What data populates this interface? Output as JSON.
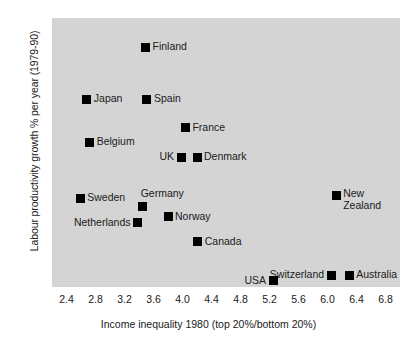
{
  "chart_data": {
    "type": "scatter",
    "title": "",
    "xlabel": "Income inequality 1980 (top 20%/bottom 20%)",
    "ylabel": "Labour productivity growth % per year (1979-90)",
    "xlim": [
      2.2,
      7.0
    ],
    "ylim": [
      0.6,
      4.0
    ],
    "xticks": [
      "2.4",
      "2.8",
      "3.2",
      "3.6",
      "4.0",
      "4.4",
      "4.8",
      "5.2",
      "5.6",
      "6.0",
      "6.4",
      "6.8"
    ],
    "yticks": [
      "3.8",
      "3.4",
      "3.0",
      "2.6",
      "2.2",
      "1.8",
      "1.4",
      "1.0",
      "0.6"
    ],
    "grid": false,
    "legend": "none",
    "marker_color": "#000000",
    "panel_color": "#d4d4d4",
    "points": [
      {
        "label": "Finland",
        "x": 3.49,
        "y": 3.63,
        "label_pos": "right"
      },
      {
        "label": "Japan",
        "x": 2.68,
        "y": 2.97,
        "label_pos": "right"
      },
      {
        "label": "Spain",
        "x": 3.51,
        "y": 2.97,
        "label_pos": "right"
      },
      {
        "label": "France",
        "x": 4.04,
        "y": 2.61,
        "label_pos": "right"
      },
      {
        "label": "Belgium",
        "x": 2.72,
        "y": 2.43,
        "label_pos": "right"
      },
      {
        "label": "UK",
        "x": 3.98,
        "y": 2.24,
        "label_pos": "left"
      },
      {
        "label": "Denmark",
        "x": 4.2,
        "y": 2.24,
        "label_pos": "right"
      },
      {
        "label": "Sweden",
        "x": 2.59,
        "y": 1.72,
        "label_pos": "right"
      },
      {
        "label": "Germany",
        "x": 3.45,
        "y": 1.62,
        "label_pos": "above"
      },
      {
        "label": "New\nZealand",
        "x": 6.12,
        "y": 1.76,
        "label_pos": "right-two"
      },
      {
        "label": "Norway",
        "x": 3.8,
        "y": 1.49,
        "label_pos": "right"
      },
      {
        "label": "Netherlands",
        "x": 3.38,
        "y": 1.41,
        "label_pos": "left"
      },
      {
        "label": "Canada",
        "x": 4.21,
        "y": 1.17,
        "label_pos": "right"
      },
      {
        "label": "Switzerland",
        "x": 6.05,
        "y": 0.75,
        "label_pos": "left"
      },
      {
        "label": "Australia",
        "x": 6.3,
        "y": 0.75,
        "label_pos": "right"
      },
      {
        "label": "USA",
        "x": 5.25,
        "y": 0.68,
        "label_pos": "left"
      }
    ]
  }
}
